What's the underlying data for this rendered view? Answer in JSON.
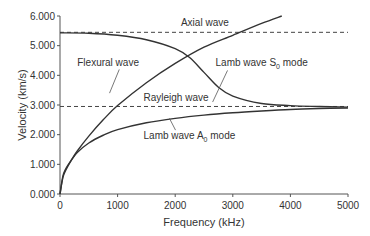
{
  "chart_data": {
    "type": "line",
    "title": "",
    "xlabel": "Frequency (kHz)",
    "ylabel": "Velocity (km/s)",
    "xlim": [
      0,
      5000
    ],
    "ylim": [
      0,
      6
    ],
    "x_ticks": [
      "0",
      "1000",
      "2000",
      "3000",
      "4000",
      "5000"
    ],
    "y_ticks": [
      "0.000",
      "1.000",
      "2.000",
      "3.000",
      "4.000",
      "5.000",
      "6.000"
    ],
    "grid": false,
    "legend": "none (inline annotations)",
    "series": [
      {
        "name": "Axial wave",
        "style": "dashed",
        "x": [
          0,
          5000
        ],
        "y": [
          5.45,
          5.45
        ]
      },
      {
        "name": "Rayleigh wave",
        "style": "dashed",
        "x": [
          0,
          5000
        ],
        "y": [
          2.95,
          2.95
        ]
      },
      {
        "name": "Flexural wave",
        "style": "solid",
        "x": [
          0,
          50,
          100,
          200,
          300,
          500,
          750,
          1000,
          1500,
          2000,
          2500,
          3000,
          3500,
          3850
        ],
        "y": [
          0,
          0.55,
          0.8,
          1.15,
          1.45,
          1.95,
          2.5,
          2.98,
          3.75,
          4.4,
          4.95,
          5.35,
          5.75,
          6.0
        ]
      },
      {
        "name": "Lamb wave S0 mode",
        "style": "solid",
        "x": [
          0,
          500,
          1000,
          1500,
          2000,
          2250,
          2500,
          2750,
          3000,
          3500,
          4000,
          4500,
          5000
        ],
        "y": [
          5.43,
          5.42,
          5.35,
          5.2,
          4.9,
          4.6,
          4.1,
          3.6,
          3.3,
          3.05,
          2.98,
          2.95,
          2.93
        ]
      },
      {
        "name": "Lamb wave A0 mode",
        "style": "solid",
        "x": [
          0,
          50,
          100,
          200,
          300,
          500,
          750,
          1000,
          1500,
          2000,
          2500,
          3000,
          3500,
          4000,
          4500,
          5000
        ],
        "y": [
          0,
          0.6,
          0.85,
          1.15,
          1.4,
          1.72,
          1.98,
          2.17,
          2.4,
          2.55,
          2.66,
          2.74,
          2.8,
          2.85,
          2.88,
          2.9
        ]
      }
    ],
    "annotations": [
      {
        "text": "Axial wave",
        "x": 2100,
        "y": 5.65
      },
      {
        "text": "Flexural wave",
        "x": 300,
        "y": 4.3,
        "leader_to": [
          860,
          3.4
        ]
      },
      {
        "text": "Lamb wave S",
        "sub": "0",
        "suffix": " mode",
        "x": 2700,
        "y": 4.3,
        "leader_to": [
          2650,
          3.1
        ]
      },
      {
        "text": "Rayleigh wave",
        "x": 1450,
        "y": 3.15
      },
      {
        "text": "Lamb wave A",
        "sub": "0",
        "suffix": " mode",
        "x": 1450,
        "y": 1.85,
        "leader_to": [
          1900,
          2.55
        ]
      }
    ]
  }
}
